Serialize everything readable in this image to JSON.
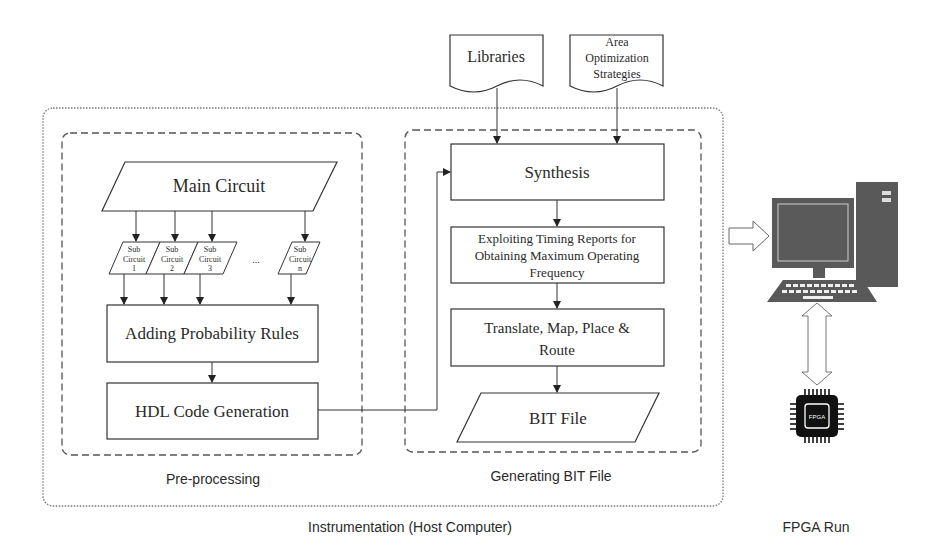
{
  "diagram": {
    "containers": {
      "host": {
        "label": "Instrumentation (Host Computer)"
      },
      "preprocessing": {
        "label": "Pre-processing"
      },
      "bitgen": {
        "label": "Generating BIT File"
      },
      "fpga": {
        "label": "FPGA Run"
      }
    },
    "inputs": {
      "libraries": {
        "label": "Libraries"
      },
      "area": {
        "lines": [
          "Area",
          "Optimization",
          "Strategies"
        ]
      }
    },
    "preprocessing": {
      "main_circuit": "Main Circuit",
      "sub_circuits": [
        {
          "l1": "Sub",
          "l2": "Circuit",
          "l3": "1"
        },
        {
          "l1": "Sub",
          "l2": "Circuit",
          "l3": "2"
        },
        {
          "l1": "Sub",
          "l2": "Circuit",
          "l3": "3"
        },
        {
          "l1": "Sub",
          "l2": "Circuit",
          "l3": "n"
        }
      ],
      "ellipsis": "...",
      "probability_rules": "Adding Probability Rules",
      "hdl": "HDL Code Generation"
    },
    "bitgen": {
      "synthesis": "Synthesis",
      "timing": [
        "Exploiting Timing Reports for",
        "Obtaining Maximum Operating",
        "Frequency"
      ],
      "translate": [
        "Translate, Map, Place &",
        "Route"
      ],
      "bit_file": "BIT File"
    },
    "hardware": {
      "chip_label": "FPGA"
    },
    "colors": {
      "stroke": "#3a3a3a",
      "computer": "#595959",
      "chip": "#111111"
    }
  }
}
